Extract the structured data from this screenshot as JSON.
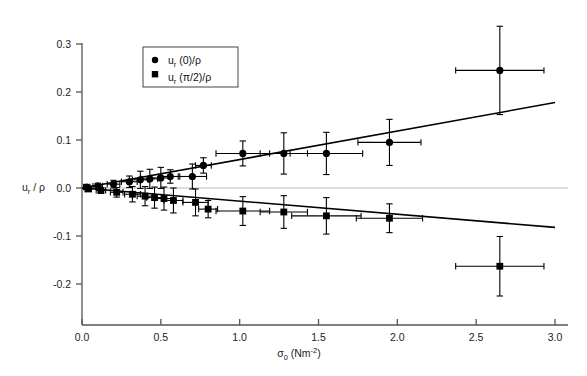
{
  "chart_data": {
    "type": "scatter",
    "title": "",
    "subtitle": "",
    "xlabel": "σ₀ (Nm⁻²)",
    "xlabel_parts": {
      "symbol": "σ",
      "subscript": "0",
      "unit_base": " (Nm",
      "unit_exp": "-2",
      "unit_close": ")"
    },
    "ylabel": "uᵣ / ρ",
    "ylabel_parts": {
      "base": "u",
      "subscript": "r",
      "rest": " / ρ"
    },
    "xlim": [
      0.0,
      3.0
    ],
    "ylim": [
      -0.235,
      0.345
    ],
    "xticks": [
      0.0,
      0.5,
      1.0,
      1.5,
      2.0,
      2.5,
      3.0
    ],
    "xtick_labels": [
      "0.0",
      "0.5",
      "1.0",
      "1.5",
      "2.0",
      "2.5",
      "3.0"
    ],
    "yticks": [
      0.3,
      0.2,
      0.1,
      0.0,
      -0.1,
      -0.2
    ],
    "ytick_labels": [
      "0.3",
      "0.2",
      "0.1",
      "0.0",
      "-0.1",
      "-0.2"
    ],
    "grid": false,
    "zero_line": true,
    "legend_position": "upper-left-inset",
    "axis_color": "#555555",
    "series": [
      {
        "name": "uᵣ (0)/ρ",
        "marker": "circle",
        "color": "#000000",
        "points": [
          {
            "x": 0.03,
            "y": 0.002,
            "xerr": 0.02,
            "yerr": 0.004
          },
          {
            "x": 0.1,
            "y": 0.004,
            "xerr": 0.03,
            "yerr": 0.006
          },
          {
            "x": 0.2,
            "y": 0.008,
            "xerr": 0.04,
            "yerr": 0.008
          },
          {
            "x": 0.3,
            "y": 0.013,
            "xerr": 0.05,
            "yerr": 0.012
          },
          {
            "x": 0.37,
            "y": 0.017,
            "xerr": 0.05,
            "yerr": 0.018
          },
          {
            "x": 0.43,
            "y": 0.019,
            "xerr": 0.05,
            "yerr": 0.02
          },
          {
            "x": 0.5,
            "y": 0.021,
            "xerr": 0.06,
            "yerr": 0.022
          },
          {
            "x": 0.56,
            "y": 0.024,
            "xerr": 0.06,
            "yerr": 0.014
          },
          {
            "x": 0.7,
            "y": 0.024,
            "xerr": 0.09,
            "yerr": 0.026
          },
          {
            "x": 0.77,
            "y": 0.047,
            "xerr": 0.05,
            "yerr": 0.016
          },
          {
            "x": 1.02,
            "y": 0.072,
            "xerr": 0.17,
            "yerr": 0.026
          },
          {
            "x": 1.28,
            "y": 0.072,
            "xerr": 0.15,
            "yerr": 0.043
          },
          {
            "x": 1.55,
            "y": 0.072,
            "xerr": 0.23,
            "yerr": 0.044
          },
          {
            "x": 1.95,
            "y": 0.095,
            "xerr": 0.2,
            "yerr": 0.048
          },
          {
            "x": 2.65,
            "y": 0.245,
            "xerr": 0.28,
            "yerr": 0.092
          }
        ],
        "fit_line": {
          "x0": 0.0,
          "y0": 0.0,
          "x1": 3.0,
          "y1": 0.178
        }
      },
      {
        "name": "uᵣ (π/2)/ρ",
        "marker": "square",
        "color": "#000000",
        "points": [
          {
            "x": 0.04,
            "y": -0.002,
            "xerr": 0.02,
            "yerr": 0.004
          },
          {
            "x": 0.12,
            "y": -0.005,
            "xerr": 0.03,
            "yerr": 0.006
          },
          {
            "x": 0.22,
            "y": -0.009,
            "xerr": 0.04,
            "yerr": 0.01
          },
          {
            "x": 0.32,
            "y": -0.013,
            "xerr": 0.05,
            "yerr": 0.016
          },
          {
            "x": 0.4,
            "y": -0.017,
            "xerr": 0.05,
            "yerr": 0.02
          },
          {
            "x": 0.46,
            "y": -0.02,
            "xerr": 0.05,
            "yerr": 0.022
          },
          {
            "x": 0.52,
            "y": -0.022,
            "xerr": 0.06,
            "yerr": 0.024
          },
          {
            "x": 0.58,
            "y": -0.026,
            "xerr": 0.06,
            "yerr": 0.026
          },
          {
            "x": 0.72,
            "y": -0.03,
            "xerr": 0.08,
            "yerr": 0.028
          },
          {
            "x": 0.8,
            "y": -0.044,
            "xerr": 0.06,
            "yerr": 0.018
          },
          {
            "x": 1.02,
            "y": -0.048,
            "xerr": 0.17,
            "yerr": 0.03
          },
          {
            "x": 1.28,
            "y": -0.05,
            "xerr": 0.15,
            "yerr": 0.034
          },
          {
            "x": 1.55,
            "y": -0.058,
            "xerr": 0.22,
            "yerr": 0.038
          },
          {
            "x": 1.95,
            "y": -0.063,
            "xerr": 0.21,
            "yerr": 0.03
          },
          {
            "x": 2.65,
            "y": -0.163,
            "xerr": 0.28,
            "yerr": 0.062
          }
        ],
        "fit_line": {
          "x0": 0.0,
          "y0": 0.0,
          "x1": 3.0,
          "y1": -0.082
        }
      }
    ]
  }
}
